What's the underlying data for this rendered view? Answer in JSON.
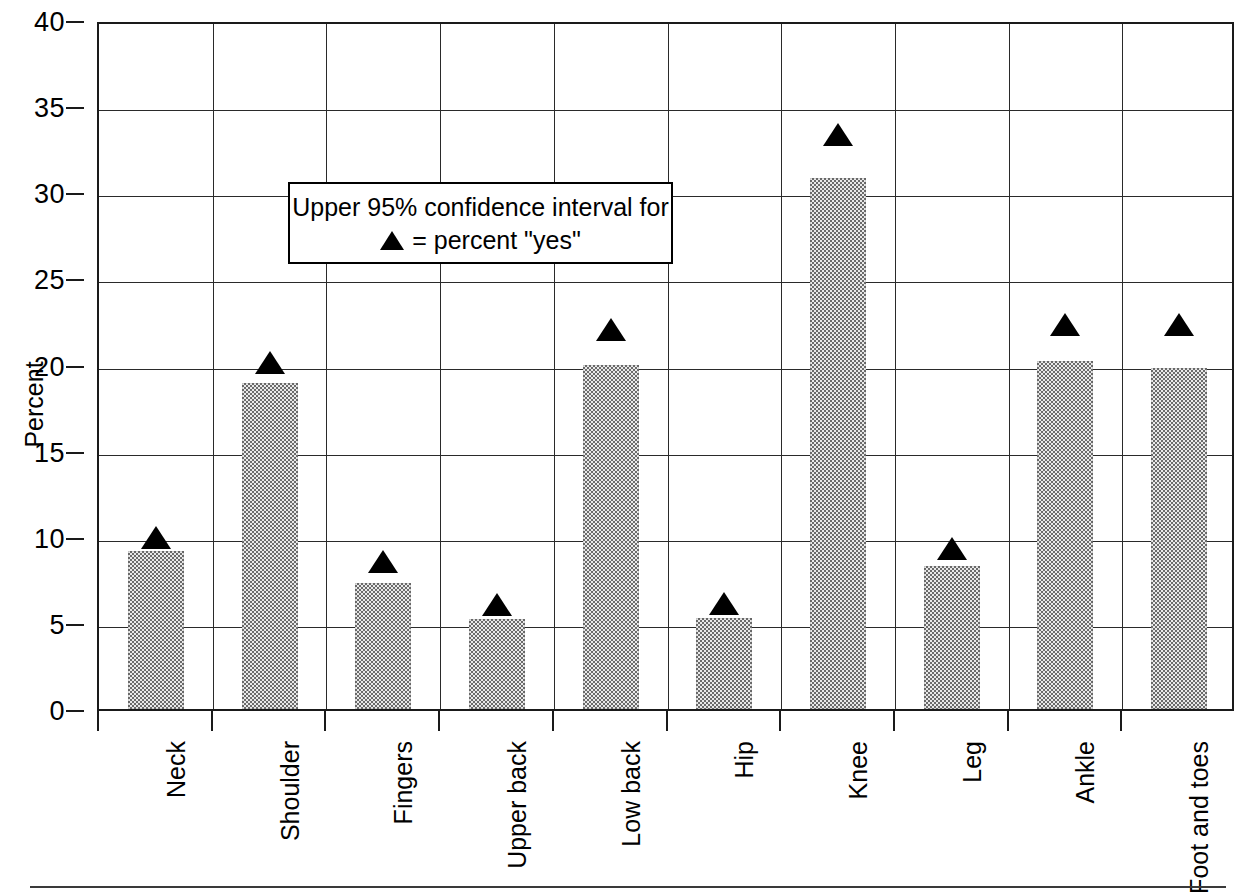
{
  "chart_data": {
    "type": "bar",
    "title": "",
    "subtitle": "",
    "xlabel": "",
    "ylabel": "Percent",
    "ylim": [
      0,
      40
    ],
    "ytick_values": [
      0,
      5,
      10,
      15,
      20,
      25,
      30,
      35,
      40
    ],
    "ytick_labels": [
      "0",
      "5",
      "10",
      "15",
      "20",
      "25",
      "30",
      "35",
      "40"
    ],
    "grid": "horizontal-and-vertical",
    "legend_position": "upper-left-inside",
    "categories": [
      "Neck",
      "Shoulder",
      "Fingers",
      "Upper back",
      "Low back",
      "Hip",
      "Knee",
      "Leg",
      "Ankle",
      "Foot and toes"
    ],
    "series": [
      {
        "name": "percent \"yes\"",
        "marker": "bar",
        "values": [
          9.2,
          18.9,
          7.3,
          5.2,
          20.0,
          5.3,
          30.8,
          8.3,
          20.2,
          19.8
        ]
      },
      {
        "name": "Upper 95% confidence interval",
        "marker": "triangle",
        "values": [
          10.2,
          20.4,
          8.8,
          6.3,
          22.3,
          6.4,
          33.6,
          9.6,
          22.6,
          22.6
        ]
      }
    ],
    "annotations": {
      "legend_line_1": "Upper 95% confidence interval for",
      "legend_line_2_symbol": "▲",
      "legend_line_2_text": "= percent \"yes\""
    },
    "colors": {
      "bar_fill_dark": "#6b6b6b",
      "bar_fill_light": "#e9e9e9",
      "marker": "#000000",
      "axis": "#1a1a1a",
      "grid": "#2a2a2a",
      "background": "#ffffff"
    }
  }
}
